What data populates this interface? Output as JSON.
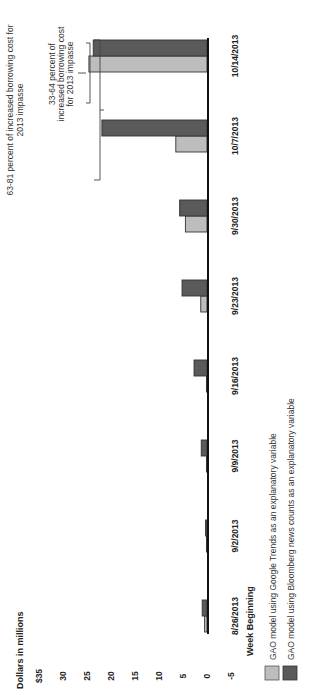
{
  "chart_data": {
    "type": "bar",
    "title": "",
    "ylabel": "Dollars in millions",
    "xlabel": "Week Beginning",
    "ylim": [
      -5,
      35
    ],
    "yticks": [
      -5,
      0,
      5,
      10,
      15,
      20,
      25,
      30,
      35
    ],
    "ytick_labels": [
      "-5",
      "0",
      "5",
      "10",
      "15",
      "20",
      "25",
      "30",
      "$35"
    ],
    "grid": false,
    "legend_position": "bottom",
    "categories": [
      "8/26/2013",
      "9/2/2013",
      "9/9/2013",
      "9/16/2013",
      "9/23/2013",
      "9/30/2013",
      "10/7/2013",
      "10/14/2013"
    ],
    "series": [
      {
        "name": "GAO model using Google Trends as an explanatory variable",
        "color": "#bdbdbd",
        "values": [
          0.5,
          0.1,
          0.1,
          0.1,
          1.3,
          4.5,
          6.5,
          24.6
        ]
      },
      {
        "name": "GAO model using Bloomberg news counts as an explanatory variable",
        "color": "#5a5a5a",
        "values": [
          1.0,
          0.3,
          1.2,
          2.7,
          5.2,
          5.7,
          21.9,
          23.7
        ]
      }
    ],
    "annotations": [
      {
        "text": "63-81 percent of increased borrowing cost for 2013 impasse",
        "span": [
          "10/7/2013",
          "10/14/2013"
        ]
      },
      {
        "text": "33-64 percent of increased borrowing cost for 2013 impasse",
        "span": [
          "10/14/2013",
          "10/14/2013"
        ]
      }
    ]
  },
  "labels": {
    "y_axis_title": "Dollars in millions",
    "x_axis_title": "Week Beginning",
    "annotation_1_line1": "63-81 percent of increased borrowing cost for",
    "annotation_1_line2": "2013 impasse",
    "annotation_2_line1": "33-64 percent of",
    "annotation_2_line2": "increased borrowing cost",
    "annotation_2_line3": "for 2013 impasse",
    "legend_google": "GAO model using Google Trends as an explanatory variable",
    "legend_bloomberg": "GAO model using Bloomberg news counts as an explanatory variable"
  }
}
